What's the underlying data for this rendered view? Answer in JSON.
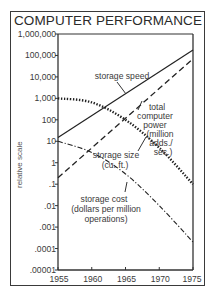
{
  "chart_data": {
    "type": "line",
    "title": "COMPUTER PERFORMANCE",
    "xlabel": "",
    "ylabel": "relative scale",
    "yscale": "log",
    "ylim": [
      1e-05,
      1000000
    ],
    "xlim": [
      1955,
      1975
    ],
    "grid": false,
    "legend": "none (inline annotations)",
    "x": [
      1955,
      1960,
      1965,
      1970,
      1975
    ],
    "x_tick_labels": [
      "1955",
      "1960",
      "1965",
      "1970",
      "1975"
    ],
    "y_tick_labels": [
      "1,000,000",
      "100,000",
      "10,000",
      "1,000",
      "100",
      "10",
      "1",
      ".1",
      ".01",
      ".001",
      ".0001",
      ".00001"
    ],
    "series": [
      {
        "name": "storage speed",
        "style": "solid",
        "values": [
          15,
          150,
          1600,
          17000,
          180000
        ]
      },
      {
        "name": "total computer power (million adds./sec.)",
        "style": "dashed",
        "values": [
          0.2,
          4.5,
          100,
          2500,
          70000
        ]
      },
      {
        "name": "storage size (cu. ft.)",
        "style": "dotted",
        "values": [
          1000,
          650,
          100,
          5,
          0.1
        ]
      },
      {
        "name": "storage cost (dollars per million operations)",
        "style": "dash-dot",
        "values": [
          10,
          3,
          0.3,
          0.01,
          0.0002
        ]
      }
    ]
  },
  "labels": {
    "title": "COMPUTER PERFORMANCE",
    "ylabel": "relative scale",
    "storage_speed": "storage speed",
    "total_power": [
      "total",
      "computer",
      "power",
      "(million",
      "adds./",
      "sec.)"
    ],
    "storage_size": [
      "storage size",
      "(cu. ft.)"
    ],
    "storage_cost": [
      "storage cost",
      "(dollars per million",
      "operations)"
    ]
  }
}
